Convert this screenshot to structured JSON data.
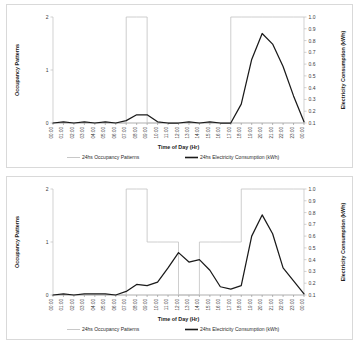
{
  "figure": {
    "charts": [
      {
        "id": "chart-top",
        "title": "",
        "xlabel": "Time of Day (Hr)",
        "ylabel_left": "Occupancy Patterns",
        "ylabel_right": "Electricity Consumption (kWh)",
        "legend": [
          {
            "label": "24hs Occupancy Patterns",
            "style": "thin-gray"
          },
          {
            "label": "24hs Electricity Consumption (kWh)",
            "style": "thick-black"
          }
        ],
        "chart_data": {
          "type": "line",
          "title": "",
          "xlabel": "Time of Day (Hr)",
          "ylabel": "Occupancy Patterns",
          "ylabel_secondary": "Electricity Consumption (kWh)",
          "grid": false,
          "legend_position": "bottom",
          "ylim": [
            0,
            2
          ],
          "yticks": [
            "0",
            "1",
            "2"
          ],
          "ylim_secondary": [
            0.1,
            1.0
          ],
          "yticks_secondary": [
            "0.1",
            "0.2",
            "0.3",
            "0.4",
            "0.5",
            "0.6",
            "0.7",
            "0.8",
            "0.9",
            "1.0"
          ],
          "categories": [
            "00:00",
            "01:00",
            "02:00",
            "03:00",
            "04:00",
            "05:00",
            "06:00",
            "07:00",
            "08:00",
            "09:00",
            "10:00",
            "11:00",
            "12:00",
            "13:00",
            "14:00",
            "15:00",
            "16:00",
            "17:00",
            "18:00",
            "19:00",
            "20:00",
            "21:00",
            "22:00",
            "23:00",
            "00:00"
          ],
          "series": [
            {
              "name": "24hs Occupancy Patterns",
              "axis": "left",
              "shape": "step",
              "values": [
                0,
                0,
                0,
                0,
                0,
                0,
                0,
                2,
                2,
                0,
                0,
                0,
                0,
                0,
                0,
                0,
                0,
                2,
                2,
                2,
                2,
                2,
                2,
                2,
                2
              ]
            },
            {
              "name": "24hs Electricity Consumption (kWh)",
              "axis": "right",
              "shape": "line",
              "values": [
                0.1,
                0.11,
                0.1,
                0.11,
                0.1,
                0.11,
                0.1,
                0.12,
                0.17,
                0.17,
                0.11,
                0.1,
                0.1,
                0.11,
                0.1,
                0.11,
                0.1,
                0.1,
                0.26,
                0.64,
                0.86,
                0.77,
                0.58,
                0.33,
                0.11
              ]
            }
          ]
        }
      },
      {
        "id": "chart-bottom",
        "title": "",
        "xlabel": "Time of Day (Hr)",
        "ylabel_left": "Occupancy Patterns",
        "ylabel_right": "Electricity Consumption (kWh)",
        "legend": [
          {
            "label": "24hs Occupancy Patterns",
            "style": "thin-gray"
          },
          {
            "label": "24hs Electricity Consumption (kWh)",
            "style": "thick-black"
          }
        ],
        "chart_data": {
          "type": "line",
          "title": "",
          "xlabel": "Time of Day (Hr)",
          "ylabel": "Occupancy Patterns",
          "ylabel_secondary": "Electricity Consumption (kWh)",
          "grid": false,
          "legend_position": "bottom",
          "ylim": [
            0,
            2
          ],
          "yticks": [
            "0",
            "1",
            "2"
          ],
          "ylim_secondary": [
            0.1,
            1.0
          ],
          "yticks_secondary": [
            "0.1",
            "0.2",
            "0.3",
            "0.4",
            "0.5",
            "0.6",
            "0.7",
            "0.8",
            "0.9",
            "1.0"
          ],
          "categories": [
            "00:00",
            "01:00",
            "02:00",
            "03:00",
            "04:00",
            "05:00",
            "06:00",
            "07:00",
            "08:00",
            "09:00",
            "10:00",
            "11:00",
            "12:00",
            "13:00",
            "14:00",
            "15:00",
            "16:00",
            "17:00",
            "18:00",
            "19:00",
            "20:00",
            "21:00",
            "22:00",
            "23:00",
            "00:00"
          ],
          "series": [
            {
              "name": "24hs Occupancy Patterns",
              "axis": "left",
              "shape": "step",
              "values": [
                0,
                0,
                0,
                0,
                0,
                0,
                0,
                2,
                2,
                1,
                1,
                1,
                0,
                0,
                1,
                1,
                1,
                1,
                2,
                2,
                2,
                2,
                2,
                2,
                2
              ]
            },
            {
              "name": "24hs Electricity Consumption (kWh)",
              "axis": "right",
              "shape": "line",
              "values": [
                0.1,
                0.11,
                0.1,
                0.11,
                0.11,
                0.11,
                0.1,
                0.13,
                0.19,
                0.18,
                0.21,
                0.33,
                0.46,
                0.38,
                0.4,
                0.31,
                0.17,
                0.15,
                0.18,
                0.6,
                0.78,
                0.62,
                0.33,
                0.22,
                0.11
              ]
            }
          ]
        }
      }
    ]
  },
  "footnote": ""
}
